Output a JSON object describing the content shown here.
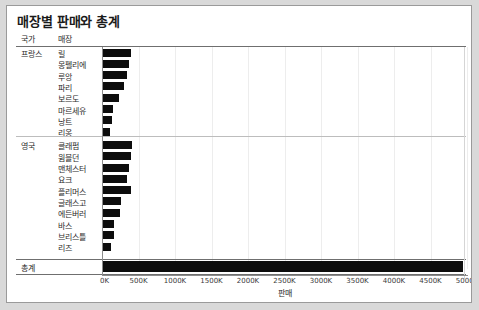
{
  "title": "매장별 판매와 총계",
  "header": {
    "country_label": "국가",
    "store_label": "매장"
  },
  "total": {
    "label": "총계",
    "value": 4950
  },
  "axis": {
    "title": "판매",
    "ticks": [
      "0K",
      "500K",
      "1000K",
      "1500K",
      "2000K",
      "2500K",
      "3000K",
      "3500K",
      "4000K",
      "4500K",
      "5000K"
    ],
    "tick_values": [
      0,
      500,
      1000,
      1500,
      2000,
      2500,
      3000,
      3500,
      4000,
      4500,
      5000
    ],
    "min": 0,
    "max": 5000
  },
  "colors": {
    "bar": "#0d0d0d",
    "grid": "#ededed",
    "rule": "#6f6f6f",
    "frame": "#9a9a9a",
    "page_background": "#d9d9d9"
  },
  "chart_data": {
    "type": "bar",
    "orientation": "horizontal",
    "title": "매장별 판매와 총계",
    "xlabel": "판매",
    "ylabel": "",
    "xlim": [
      0,
      5000
    ],
    "grid": true,
    "legend": null,
    "units": "K",
    "groups": [
      {
        "country": "프랑스",
        "stores": [
          "릴",
          "몽펠리에",
          "루앙",
          "파리",
          "보르도",
          "마르세유",
          "낭트",
          "리옹"
        ],
        "values": [
          400,
          370,
          340,
          300,
          230,
          150,
          140,
          105
        ]
      },
      {
        "country": "영국",
        "stores": [
          "클래펌",
          "윔블던",
          "맨체스터",
          "요크",
          "플리머스",
          "글래스고",
          "에든버러",
          "바스",
          "브리스틀",
          "리즈"
        ],
        "values": [
          405,
          400,
          365,
          345,
          395,
          260,
          250,
          160,
          170,
          130
        ]
      }
    ],
    "total_row": {
      "label": "총계",
      "value": 4950
    }
  }
}
